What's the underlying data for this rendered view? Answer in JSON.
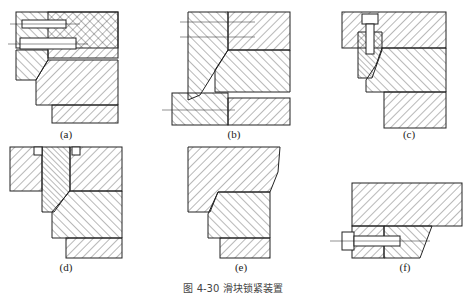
{
  "figure": {
    "caption": "图 4-30  滑块锁紧装置",
    "panels": [
      {
        "id": "a",
        "label": "(a)",
        "description": "Locking block fixed by pin and screw from side"
      },
      {
        "id": "b",
        "label": "(b)",
        "description": "Integral inclined locking wedge inserted in plate"
      },
      {
        "id": "c",
        "label": "(c)",
        "description": "Locking wedge fixed by vertical socket screw"
      },
      {
        "id": "d",
        "label": "(d)",
        "description": "Wedge insert with shoulder in top plate"
      },
      {
        "id": "e",
        "label": "(e)",
        "description": "Integral locking face on plate"
      },
      {
        "id": "f",
        "label": "(f)",
        "description": "Wedge fixed by horizontal screw"
      }
    ]
  },
  "colors": {
    "line": "#222222",
    "hatch": "#333333",
    "background": "#ffffff"
  }
}
